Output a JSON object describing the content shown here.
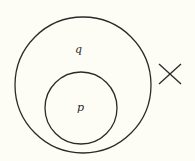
{
  "diagram": {
    "type": "venn-subset",
    "outer_set": {
      "label": "q"
    },
    "inner_set": {
      "label": "p"
    },
    "marker": {
      "symbol": "cross",
      "meaning": "element outside both sets"
    },
    "colors": {
      "stroke": "#2a2a2a",
      "background": "#fdfdf5"
    }
  }
}
